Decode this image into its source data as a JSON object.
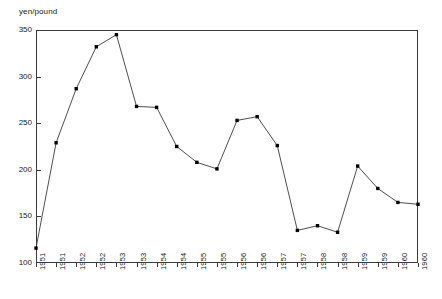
{
  "chart_data": {
    "type": "line",
    "title": "",
    "subtitle": "",
    "xlabel": "",
    "ylabel": "yen/pound",
    "ylim": [
      100,
      350
    ],
    "yticks": [
      100,
      150,
      200,
      250,
      300,
      350
    ],
    "grid": false,
    "legend": false,
    "marker": "filled-square",
    "line_color": "#3a3a3a",
    "marker_color": "#000000",
    "categories": [
      "1951",
      "1951",
      "1952",
      "1952",
      "1953",
      "1953",
      "1954",
      "1954",
      "1955",
      "1955",
      "1956",
      "1956",
      "1957",
      "1957",
      "1958",
      "1958",
      "1959",
      "1959",
      "1960",
      "1960"
    ],
    "values": [
      116,
      229,
      287,
      332,
      345,
      268,
      267,
      225,
      208,
      201,
      253,
      257,
      226,
      135,
      140,
      133,
      204,
      180,
      165,
      163
    ],
    "series": [
      {
        "name": "yen/pound",
        "values": [
          116,
          229,
          287,
          332,
          345,
          268,
          267,
          225,
          208,
          201,
          253,
          257,
          226,
          135,
          140,
          133,
          204,
          180,
          165,
          163
        ]
      }
    ],
    "annotations": []
  },
  "axis": {
    "y_caption": "yen/pound",
    "y_tick_labels": [
      "350",
      "300",
      "250",
      "200",
      "150",
      "100"
    ],
    "x_tick_labels": [
      "1951",
      "1951",
      "1952",
      "1952",
      "1953",
      "1953",
      "1954",
      "1954",
      "1955",
      "1955",
      "1956",
      "1956",
      "1957",
      "1957",
      "1958",
      "1958",
      "1959",
      "1959",
      "1960",
      "1960"
    ]
  }
}
